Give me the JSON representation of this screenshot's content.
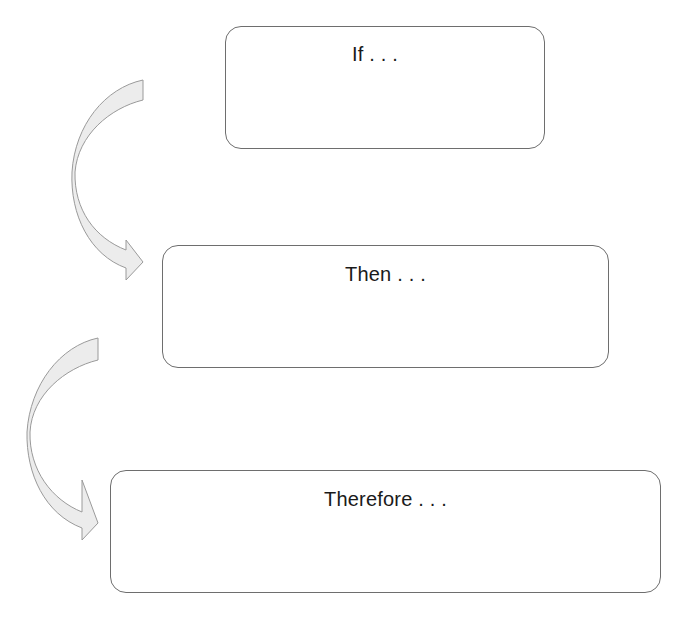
{
  "diagram": {
    "type": "flow",
    "boxes": [
      {
        "id": "if",
        "label": "If . . ."
      },
      {
        "id": "then",
        "label": "Then . . ."
      },
      {
        "id": "therefore",
        "label": "Therefore . . ."
      }
    ],
    "connectors": [
      {
        "from": "if",
        "to": "then",
        "style": "curved-block-arrow"
      },
      {
        "from": "then",
        "to": "therefore",
        "style": "curved-block-arrow"
      }
    ],
    "colors": {
      "box_border": "#6e6e6e",
      "arrow_fill": "#ececec",
      "arrow_stroke": "#9a9a9a",
      "text": "#1a1a1a"
    }
  }
}
